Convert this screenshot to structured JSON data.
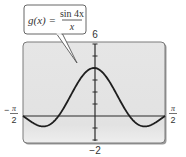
{
  "chart_data": {
    "type": "line",
    "title": "",
    "function": "g(x) = sin 4x / x",
    "callout": {
      "lhs": "g(x) =",
      "numerator": "sin 4x",
      "denominator": "x"
    },
    "xlabel": "",
    "ylabel": "",
    "xlim": [
      -1.5708,
      1.5708
    ],
    "ylim": [
      -2,
      6
    ],
    "x_tick_labels": {
      "left": {
        "sign": "−",
        "numerator": "π",
        "denominator": "2"
      },
      "right": {
        "sign": "",
        "numerator": "π",
        "denominator": "2"
      }
    },
    "y_tick_labels": {
      "top": "6",
      "bottom": "−2"
    },
    "y_ticks": [
      -2,
      -1,
      0,
      1,
      2,
      3,
      4,
      5,
      6
    ],
    "grid": false,
    "legend": null,
    "series": [
      {
        "name": "g(x) = sin 4x / x",
        "x": [
          -1.5708,
          -1.4,
          -1.2,
          -1.123,
          -1.0,
          -0.785,
          -0.6,
          -0.4,
          -0.2,
          0,
          0.2,
          0.4,
          0.6,
          0.785,
          1.0,
          1.123,
          1.2,
          1.4,
          1.5708
        ],
        "y": [
          0.0,
          -0.45,
          -0.83,
          -0.87,
          -0.76,
          0.0,
          1.12,
          2.5,
          3.59,
          4.0,
          3.59,
          2.5,
          1.12,
          0.0,
          -0.76,
          -0.87,
          -0.83,
          -0.45,
          0.0
        ]
      }
    ],
    "key_points": {
      "maximum": {
        "x": 0,
        "y": 4
      },
      "zeros": [
        -0.785,
        0.785
      ],
      "minima": [
        {
          "x": -1.123,
          "y": -0.87
        },
        {
          "x": 1.123,
          "y": -0.87
        }
      ]
    }
  },
  "colors": {
    "plot_background": "#e4e4e4",
    "frame_border": "#6e6e6e",
    "curve": "#1e1e1e",
    "axis": "#2a2a2a",
    "text": "#333333",
    "callout_border": "#555555",
    "callout_fill": "#ffffff"
  }
}
